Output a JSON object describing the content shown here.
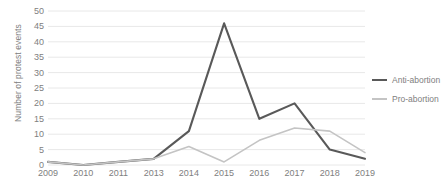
{
  "chart_data": {
    "type": "line",
    "title": "",
    "xlabel": "",
    "ylabel": "Number of protest events",
    "categories": [
      "2009",
      "2010",
      "2011",
      "2013",
      "2014",
      "2015",
      "2016",
      "2017",
      "2018",
      "2019"
    ],
    "ylim": [
      0,
      50
    ],
    "y_ticks": [
      0,
      5,
      10,
      15,
      20,
      25,
      30,
      35,
      40,
      45,
      50
    ],
    "grid": "horizontal",
    "legend_position": "right",
    "series": [
      {
        "name": "Anti-abortion",
        "color": "#595959",
        "width": 2.1,
        "values": [
          1,
          0,
          1,
          2,
          11,
          46,
          15,
          20,
          5,
          2
        ]
      },
      {
        "name": "Pro-abortion",
        "color": "#c4c4c4",
        "width": 1.6,
        "values": [
          1,
          0,
          1,
          2,
          6,
          1,
          8,
          12,
          11,
          4
        ]
      }
    ]
  }
}
